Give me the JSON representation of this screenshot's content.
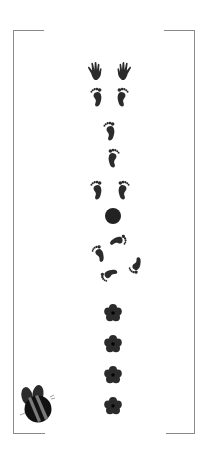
{
  "page": {
    "background": "#ffffff",
    "ink_color": "#2b2b2b",
    "frame_color": "#8a8a8a",
    "stripe_color": "#7a7a7a"
  },
  "icons": {
    "hands": [
      "left-hand-icon",
      "right-hand-icon"
    ],
    "feet_pair_top": [
      "left-foot-icon",
      "right-foot-icon"
    ],
    "single_feet": [
      "left-foot-icon",
      "right-foot-icon"
    ],
    "feet_pair_middle": [
      "left-foot-icon",
      "right-foot-icon"
    ],
    "dot": "circle-icon",
    "feet_circle": [
      "foot-icon",
      "foot-icon",
      "foot-icon",
      "foot-icon"
    ],
    "flowers": [
      "flower-icon",
      "flower-icon",
      "flower-icon",
      "flower-icon"
    ],
    "bee": "bee-icon"
  }
}
